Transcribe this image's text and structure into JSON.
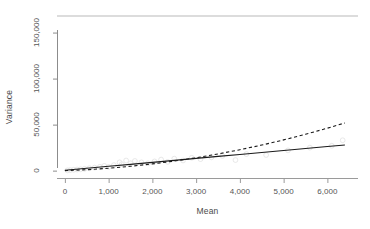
{
  "chart_data": {
    "type": "line",
    "title": "",
    "xlabel": "Mean",
    "ylabel": "Variance",
    "xlim": [
      -180,
      6700
    ],
    "ylim": [
      -8000,
      168000
    ],
    "xticks": [
      0,
      1000,
      2000,
      3000,
      4000,
      5000,
      6000
    ],
    "xticklabels": [
      "0",
      "1,000",
      "2,000",
      "3,000",
      "4,000",
      "5,000",
      "6,000"
    ],
    "yticks": [
      0,
      50000,
      100000,
      150000
    ],
    "yticklabels": [
      "0",
      "50,000",
      "100,000",
      "150,000"
    ],
    "grid": false,
    "legend": "none",
    "box": "top-and-left-axis-lines",
    "series": [
      {
        "name": "linear mean-variance fit",
        "style": "solid",
        "color": "#1a1a1a",
        "x": [
          0,
          500,
          1000,
          1500,
          2000,
          2500,
          3000,
          3500,
          4000,
          4500,
          5000,
          5500,
          6000,
          6400
        ],
        "y": [
          400,
          2550,
          4700,
          6850,
          9000,
          11150,
          13300,
          15450,
          17600,
          19750,
          21900,
          24050,
          26200,
          27900
        ]
      },
      {
        "name": "quadratic mean-variance fit",
        "style": "dashed",
        "color": "#1a1a1a",
        "x": [
          0,
          500,
          1000,
          1500,
          2000,
          2500,
          3000,
          3500,
          4000,
          4500,
          5000,
          5500,
          6000,
          6400
        ],
        "y": [
          0,
          1000,
          2600,
          4700,
          7300,
          10400,
          14000,
          18100,
          22700,
          27800,
          33400,
          39500,
          46100,
          51800
        ]
      }
    ],
    "scatter": {
      "name": "observed mean vs variance points",
      "marker": "open-circle",
      "color": "#e2e2e2",
      "points": [
        [
          60,
          300
        ],
        [
          120,
          600
        ],
        [
          200,
          900
        ],
        [
          280,
          1200
        ],
        [
          360,
          1500
        ],
        [
          450,
          2000
        ],
        [
          560,
          2600
        ],
        [
          680,
          3300
        ],
        [
          800,
          4200
        ],
        [
          900,
          5200
        ],
        [
          1000,
          4000
        ],
        [
          1120,
          6000
        ],
        [
          1250,
          9000
        ],
        [
          1300,
          7000
        ],
        [
          1400,
          11000
        ],
        [
          1500,
          8000
        ],
        [
          1600,
          10500
        ],
        [
          1750,
          9000
        ],
        [
          1900,
          8000
        ],
        [
          2050,
          10000
        ],
        [
          2200,
          12000
        ],
        [
          2350,
          9500
        ],
        [
          2500,
          13000
        ],
        [
          2700,
          11000
        ],
        [
          2900,
          14000
        ],
        [
          3100,
          12500
        ],
        [
          3350,
          14500
        ],
        [
          3600,
          16000
        ],
        [
          3900,
          11500
        ],
        [
          4150,
          18000
        ],
        [
          4600,
          17000
        ],
        [
          5100,
          22000
        ],
        [
          5600,
          25000
        ],
        [
          6100,
          27000
        ],
        [
          6350,
          33000
        ]
      ]
    }
  },
  "axis": {
    "y_title": "Variance",
    "x_title": "Mean"
  }
}
